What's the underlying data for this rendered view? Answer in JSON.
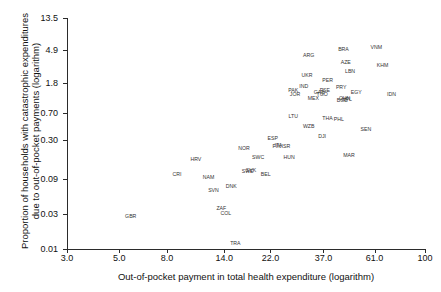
{
  "chart_data": {
    "type": "scatter",
    "title": "",
    "xlabel": "Out-of-pocket payment in total health expenditure (logarithm)",
    "ylabel_line1": "Proportion of households with catastrophic expenditures",
    "ylabel_line2": "due to out-of-pocket payments (logarithm)",
    "x_scale": "log",
    "y_scale": "log",
    "xticks": [
      "3.0",
      "5.0",
      "8.0",
      "14.0",
      "22.0",
      "37.0",
      "61.0",
      "100"
    ],
    "xtick_values": [
      3.0,
      5.0,
      8.0,
      14.0,
      22.0,
      37.0,
      61.0,
      100
    ],
    "yticks": [
      "13.5",
      "4.9",
      "1.8",
      "0.70",
      "0.30",
      "0.09",
      "0.03",
      "0.01"
    ],
    "ytick_values": [
      13.5,
      4.9,
      1.8,
      0.7,
      0.3,
      0.09,
      0.03,
      0.01
    ],
    "xlim": [
      3.0,
      100
    ],
    "ylim": [
      0.01,
      13.5
    ],
    "grid": false,
    "legend": false,
    "point_style": "text-label",
    "points": [
      {
        "label": "GBR",
        "x": 5.6,
        "y": 0.028
      },
      {
        "label": "CRI",
        "x": 8.8,
        "y": 0.105
      },
      {
        "label": "HRV",
        "x": 10.6,
        "y": 0.165
      },
      {
        "label": "NAM",
        "x": 12.0,
        "y": 0.095
      },
      {
        "label": "SVN",
        "x": 12.6,
        "y": 0.064
      },
      {
        "label": "ZAF",
        "x": 13.6,
        "y": 0.036
      },
      {
        "label": "COL",
        "x": 14.2,
        "y": 0.031
      },
      {
        "label": "DNK",
        "x": 15.0,
        "y": 0.072
      },
      {
        "label": "TRA",
        "x": 15.6,
        "y": 0.012
      },
      {
        "label": "SWE",
        "x": 17.6,
        "y": 0.115
      },
      {
        "label": "SVK",
        "x": 18.2,
        "y": 0.118
      },
      {
        "label": "BEL",
        "x": 21.0,
        "y": 0.105
      },
      {
        "label": "NOR",
        "x": 17.0,
        "y": 0.235
      },
      {
        "label": "SWC",
        "x": 19.5,
        "y": 0.175
      },
      {
        "label": "ESP",
        "x": 22.5,
        "y": 0.315
      },
      {
        "label": "FIN",
        "x": 23.4,
        "y": 0.245
      },
      {
        "label": "ITA",
        "x": 23.8,
        "y": 0.255
      },
      {
        "label": "ISR",
        "x": 25.6,
        "y": 0.245
      },
      {
        "label": "HUN",
        "x": 26.4,
        "y": 0.175
      },
      {
        "label": "LTU",
        "x": 27.5,
        "y": 0.64
      },
      {
        "label": "WZB",
        "x": 32.0,
        "y": 0.46
      },
      {
        "label": "DJI",
        "x": 36.5,
        "y": 0.345
      },
      {
        "label": "THA",
        "x": 38.5,
        "y": 0.6
      },
      {
        "label": "PHL",
        "x": 43.0,
        "y": 0.58
      },
      {
        "label": "SEN",
        "x": 56.0,
        "y": 0.42
      },
      {
        "label": "MAR",
        "x": 47.5,
        "y": 0.185
      },
      {
        "label": "PAK",
        "x": 27.5,
        "y": 1.45
      },
      {
        "label": "JOR",
        "x": 28.0,
        "y": 1.25
      },
      {
        "label": "IND",
        "x": 30.5,
        "y": 1.6
      },
      {
        "label": "UKR",
        "x": 31.5,
        "y": 2.3
      },
      {
        "label": "MEX",
        "x": 33.5,
        "y": 1.1
      },
      {
        "label": "GAB",
        "x": 35.5,
        "y": 1.35
      },
      {
        "label": "TGO",
        "x": 36.5,
        "y": 1.25
      },
      {
        "label": "PSE",
        "x": 37.5,
        "y": 1.42
      },
      {
        "label": "ARG",
        "x": 32.0,
        "y": 4.2
      },
      {
        "label": "PER",
        "x": 38.5,
        "y": 1.95
      },
      {
        "label": "PRY",
        "x": 44.0,
        "y": 1.55
      },
      {
        "label": "BGD",
        "x": 44.5,
        "y": 1.05
      },
      {
        "label": "CHN",
        "x": 45.5,
        "y": 1.1
      },
      {
        "label": "NPL",
        "x": 46.5,
        "y": 1.08
      },
      {
        "label": "EGY",
        "x": 51.0,
        "y": 1.35
      },
      {
        "label": "LBN",
        "x": 48.0,
        "y": 2.6
      },
      {
        "label": "AZE",
        "x": 46.0,
        "y": 3.4
      },
      {
        "label": "BRA",
        "x": 45.0,
        "y": 5.2
      },
      {
        "label": "VNM",
        "x": 62.0,
        "y": 5.4
      },
      {
        "label": "KHM",
        "x": 66.0,
        "y": 3.1
      },
      {
        "label": "IDN",
        "x": 72.0,
        "y": 1.25
      }
    ]
  }
}
